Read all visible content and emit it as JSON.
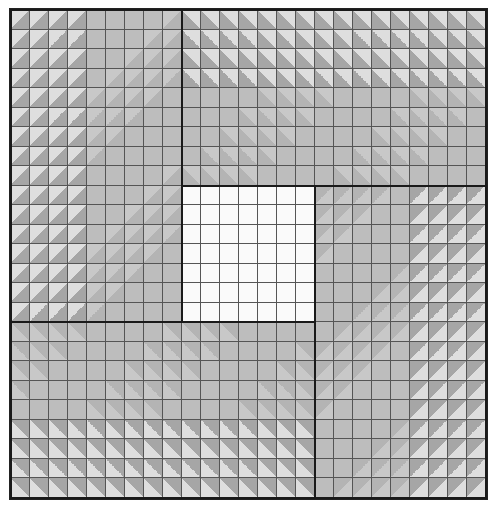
{
  "figure": {
    "grid": {
      "cols": 25,
      "rows": 25
    },
    "colors": {
      "base": "#bdbdbd",
      "light": "#dedede",
      "dark": "#a6a6a6",
      "faint_light": "#c8c8c8",
      "faint_dark": "#b4b4b4",
      "center": "#fafafa",
      "grid_line": "#555555",
      "block_line": "#1a1a1a"
    },
    "blocks": [
      {
        "name": "left-arm",
        "col": 0,
        "row": 0,
        "cols": 9,
        "rows": 16,
        "light_corner": "top-left",
        "strong_edge": "left",
        "strong_depth": 4
      },
      {
        "name": "top-arm",
        "col": 9,
        "row": 0,
        "cols": 16,
        "rows": 9,
        "light_corner": "top-right",
        "strong_edge": "top",
        "strong_depth": 4
      },
      {
        "name": "right-arm",
        "col": 16,
        "row": 9,
        "cols": 9,
        "rows": 16,
        "light_corner": "bottom-right",
        "strong_edge": "right",
        "strong_depth": 4
      },
      {
        "name": "bottom-arm",
        "col": 0,
        "row": 16,
        "cols": 16,
        "rows": 9,
        "light_corner": "bottom-left",
        "strong_edge": "bottom",
        "strong_depth": 4
      },
      {
        "name": "center-square",
        "col": 9,
        "row": 9,
        "cols": 7,
        "rows": 7,
        "light_corner": "none",
        "strong_edge": "none",
        "strong_depth": 0
      }
    ]
  }
}
